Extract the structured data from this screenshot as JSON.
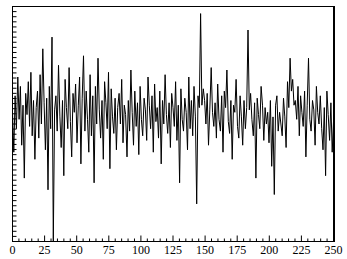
{
  "chart_data": {
    "type": "line",
    "title": "",
    "xlabel": "",
    "ylabel": "",
    "xlim": [
      0,
      250
    ],
    "ylim": [
      0,
      100
    ],
    "grid": false,
    "legend": null,
    "x_ticks": [
      "0",
      "25",
      "50",
      "75",
      "100",
      "125",
      "150",
      "175",
      "200",
      "225",
      "250"
    ],
    "y_ticks_labeled": false,
    "line_color": "#000000",
    "series": [
      {
        "name": "signal",
        "values": [
          55,
          38,
          62,
          48,
          70,
          52,
          66,
          41,
          58,
          27,
          63,
          54,
          68,
          49,
          72,
          45,
          60,
          35,
          57,
          64,
          44,
          71,
          50,
          82,
          59,
          39,
          61,
          22,
          66,
          48,
          87,
          0,
          56,
          62,
          47,
          75,
          53,
          40,
          60,
          28,
          69,
          57,
          48,
          74,
          51,
          36,
          63,
          55,
          67,
          42,
          58,
          70,
          33,
          61,
          79,
          47,
          64,
          52,
          38,
          71,
          45,
          62,
          25,
          66,
          50,
          78,
          56,
          44,
          60,
          35,
          68,
          59,
          48,
          72,
          31,
          65,
          53,
          46,
          61,
          39,
          57,
          63,
          50,
          69,
          42,
          58,
          54,
          36,
          60,
          47,
          73,
          55,
          41,
          64,
          49,
          59,
          37,
          66,
          52,
          45,
          61,
          56,
          43,
          70,
          58,
          48,
          62,
          38,
          67,
          51,
          57,
          44,
          64,
          33,
          60,
          50,
          71,
          54,
          46,
          59,
          40,
          63,
          57,
          49,
          68,
          43,
          58,
          25,
          65,
          52,
          47,
          61,
          55,
          39,
          70,
          48,
          60,
          45,
          66,
          53,
          16,
          62,
          57,
          97,
          58,
          65,
          60,
          50,
          63,
          41,
          56,
          74,
          55,
          49,
          59,
          44,
          67,
          52,
          47,
          62,
          38,
          64,
          57,
          73,
          51,
          46,
          60,
          35,
          58,
          55,
          69,
          49,
          44,
          62,
          53,
          41,
          60,
          48,
          57,
          90,
          56,
          63,
          52,
          45,
          59,
          27,
          61,
          54,
          48,
          66,
          58,
          43,
          57,
          50,
          55,
          42,
          60,
          32,
          53,
          20,
          58,
          62,
          47,
          55,
          50,
          45,
          61,
          53,
          40,
          68,
          57,
          78,
          64,
          69,
          58,
          60,
          52,
          66,
          45,
          62,
          55,
          49,
          64,
          36,
          58,
          78,
          52,
          47,
          60,
          56,
          41,
          66,
          55,
          50,
          62,
          48,
          39,
          57,
          28,
          64,
          54,
          43,
          59,
          38,
          51
        ]
      }
    ]
  },
  "axes": {
    "x_tick_labels": [
      "0",
      "25",
      "50",
      "75",
      "100",
      "125",
      "150",
      "175",
      "200",
      "225",
      "250"
    ]
  }
}
